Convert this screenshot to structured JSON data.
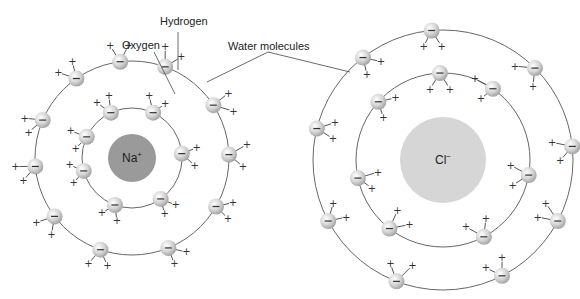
{
  "labels": {
    "hydrogen": "Hydrogen",
    "oxygen": "Oxygen",
    "water_molecules": "Water molecules"
  },
  "ions": {
    "sodium": {
      "symbol": "Na",
      "charge": "+",
      "fill": "#9a9a9a"
    },
    "chloride": {
      "symbol": "Cl",
      "charge": "−",
      "fill": "#d6d6d6"
    }
  },
  "symbols": {
    "positive": "+",
    "negative": "−"
  },
  "colors": {
    "oxygen_fill": "#c8c8c8",
    "ring_stroke": "#555555",
    "background": "#ffffff"
  },
  "left_cluster": {
    "center": [
      132,
      158
    ],
    "ion_radius": 24,
    "rings": [
      50,
      97
    ],
    "inner_waters": [
      {
        "angle": 205,
        "h": [
          [
            -16,
            -6
          ],
          [
            -11,
            12
          ]
        ]
      },
      {
        "angle": 245,
        "h": [
          [
            -14,
            -10
          ],
          [
            -2,
            -17
          ]
        ]
      },
      {
        "angle": 295,
        "h": [
          [
            -4,
            -17
          ],
          [
            12,
            -9
          ]
        ]
      },
      {
        "angle": 355,
        "h": [
          [
            15,
            -6
          ],
          [
            13,
            12
          ]
        ]
      },
      {
        "angle": 55,
        "h": [
          [
            15,
            6
          ],
          [
            4,
            15
          ]
        ]
      },
      {
        "angle": 110,
        "h": [
          [
            -13,
            8
          ],
          [
            2,
            16
          ]
        ]
      },
      {
        "angle": 165,
        "h": [
          [
            -14,
            -6
          ],
          [
            -10,
            12
          ]
        ]
      }
    ],
    "outer_waters": [
      {
        "angle": 263,
        "h": [
          [
            -10,
            -16
          ],
          [
            8,
            -16
          ]
        ]
      },
      {
        "angle": 235,
        "h": [
          [
            -18,
            -6
          ],
          [
            -4,
            -17
          ]
        ]
      },
      {
        "angle": 203,
        "h": [
          [
            -18,
            -2
          ],
          [
            -14,
            12
          ]
        ]
      },
      {
        "angle": 175,
        "h": [
          [
            -20,
            0
          ],
          [
            -12,
            14
          ]
        ]
      },
      {
        "angle": 143,
        "h": [
          [
            -18,
            6
          ],
          [
            -3,
            18
          ]
        ]
      },
      {
        "angle": 109,
        "h": [
          [
            -12,
            14
          ],
          [
            7,
            16
          ]
        ]
      },
      {
        "angle": 68,
        "h": [
          [
            18,
            4
          ],
          [
            6,
            16
          ]
        ]
      },
      {
        "angle": 30,
        "h": [
          [
            17,
            -4
          ],
          [
            12,
            12
          ]
        ]
      },
      {
        "angle": 358,
        "h": [
          [
            18,
            -10
          ],
          [
            14,
            12
          ]
        ]
      },
      {
        "angle": 327,
        "h": [
          [
            15,
            -12
          ],
          [
            20,
            6
          ]
        ]
      },
      {
        "angle": 290,
        "h": [
          [
            0,
            -20
          ],
          [
            16,
            -10
          ]
        ]
      }
    ]
  },
  "right_cluster": {
    "center": [
      443,
      160
    ],
    "ion_radius": 43,
    "rings": [
      87,
      130
    ],
    "inner_waters": [
      {
        "angle": 268,
        "h": [
          [
            -10,
            16
          ],
          [
            10,
            16
          ]
        ]
      },
      {
        "angle": 222,
        "h": [
          [
            17,
            -4
          ],
          [
            5,
            16
          ]
        ]
      },
      {
        "angle": 168,
        "h": [
          [
            20,
            -6
          ],
          [
            14,
            10
          ]
        ]
      },
      {
        "angle": 128,
        "h": [
          [
            8,
            -18
          ],
          [
            20,
            -4
          ]
        ]
      },
      {
        "angle": 62,
        "h": [
          [
            -18,
            -10
          ],
          [
            2,
            -18
          ]
        ]
      },
      {
        "angle": 10,
        "h": [
          [
            -18,
            -10
          ],
          [
            -16,
            10
          ]
        ]
      },
      {
        "angle": 305,
        "h": [
          [
            -18,
            -10
          ],
          [
            -12,
            10
          ]
        ]
      }
    ],
    "outer_waters": [
      {
        "angle": 265,
        "h": [
          [
            -8,
            16
          ],
          [
            10,
            16
          ]
        ]
      },
      {
        "angle": 232,
        "h": [
          [
            18,
            4
          ],
          [
            4,
            17
          ]
        ]
      },
      {
        "angle": 194,
        "h": [
          [
            18,
            -6
          ],
          [
            16,
            10
          ]
        ]
      },
      {
        "angle": 152,
        "h": [
          [
            5,
            -18
          ],
          [
            18,
            -4
          ]
        ]
      },
      {
        "angle": 111,
        "h": [
          [
            -6,
            -18
          ],
          [
            16,
            -16
          ]
        ]
      },
      {
        "angle": 63,
        "h": [
          [
            -16,
            -8
          ],
          [
            0,
            -18
          ]
        ]
      },
      {
        "angle": 28,
        "h": [
          [
            -20,
            -4
          ],
          [
            -12,
            -18
          ]
        ]
      },
      {
        "angle": 354,
        "h": [
          [
            -20,
            -4
          ],
          [
            -12,
            14
          ]
        ]
      },
      {
        "angle": 315,
        "h": [
          [
            -20,
            -2
          ],
          [
            -2,
            18
          ]
        ]
      }
    ]
  }
}
